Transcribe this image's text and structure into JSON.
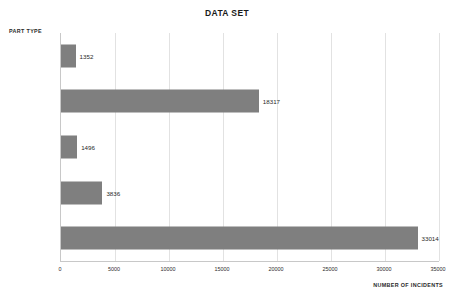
{
  "chart_data": {
    "type": "bar",
    "orientation": "horizontal",
    "title": "DATA SET",
    "xlabel": "NUMBER OF INCIDENTS",
    "ylabel": "PART TYPE",
    "categories": [
      "Misc",
      "Component",
      "Fitting",
      "Pipe (WM)",
      "Pipe (HC)"
    ],
    "values": [
      1352,
      18317,
      1496,
      3836,
      33014
    ],
    "value_labels": [
      "1352",
      "18317",
      "1496",
      "3836",
      "33014"
    ],
    "xlim": [
      0,
      35000
    ],
    "xticks": [
      0,
      5000,
      10000,
      15000,
      20000,
      25000,
      30000,
      35000
    ],
    "xtick_labels": [
      "0",
      "5000",
      "10000",
      "15000",
      "20000",
      "25000",
      "30000",
      "35000"
    ],
    "grid": "vertical",
    "legend": null,
    "bar_color": "#7f7f7f",
    "gridline_color": "#e2e2e2",
    "axis_color": "#c8c8c8",
    "background": "#ffffff"
  }
}
